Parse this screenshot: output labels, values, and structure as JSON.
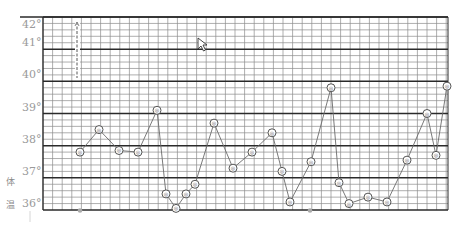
{
  "chart_data": {
    "type": "line",
    "title": "",
    "xlabel": "",
    "ylabel": "体温",
    "ylim": [
      36,
      42
    ],
    "y_ticks": [
      "42°",
      "41°",
      "40°",
      "39°",
      "38°",
      "37°",
      "36°"
    ],
    "grid": true,
    "legend": null,
    "series": [
      {
        "name": "体温",
        "x": [
          80,
          99,
          119,
          138,
          157,
          166,
          176,
          186,
          195,
          214,
          233,
          252,
          272,
          282,
          290,
          311,
          331,
          339,
          349,
          368,
          387,
          407,
          427,
          436,
          447
        ],
        "values": [
          37.8,
          38.5,
          37.85,
          37.8,
          39.1,
          36.5,
          36.05,
          36.5,
          36.8,
          38.7,
          37.3,
          37.8,
          38.4,
          37.2,
          36.25,
          37.5,
          39.8,
          36.85,
          36.2,
          36.4,
          36.25,
          37.55,
          39.0,
          37.7,
          39.85
        ]
      }
    ],
    "annotations": [
      {
        "type": "vertical-text",
        "x": 77,
        "y_top": 22,
        "y_bottom": 78,
        "text": "illegible vertical note"
      },
      {
        "type": "marker",
        "x": 80,
        "y_value": 36.0
      },
      {
        "type": "marker",
        "x": 310,
        "y_value": 36.0
      }
    ]
  },
  "colors": {
    "grid_thin": "#8c8c8c",
    "grid_thick": "#2a2a2a",
    "line": "#6b6b6b",
    "label": "#9a9a9a"
  },
  "labels": {
    "side": "体温"
  }
}
